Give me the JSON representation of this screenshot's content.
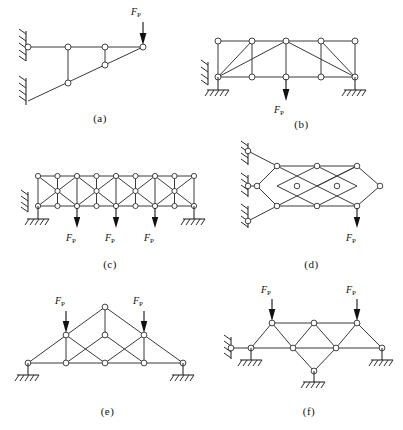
{
  "sheet": {
    "title": "Truss structure exercise figures",
    "figure_count": 6,
    "load_symbol": "F",
    "load_subscript": "P",
    "line_color": "#3a3a3a",
    "joint_fill": "#ffffff",
    "joint_stroke": "#2f2f2f",
    "text_color": "#111111",
    "background": "#ffffff"
  },
  "figures": [
    {
      "id": "a",
      "caption": "(a)",
      "description": "Cantilever truss with horizontal top chord, inclined bottom chord and two vertical members, fixed to wall at two levels",
      "loads": [
        {
          "label": "F",
          "subscript": "P",
          "direction": "down",
          "at_joint": "top-right"
        }
      ],
      "supports": [
        {
          "type": "wall-hatch",
          "position": "upper-left"
        },
        {
          "type": "wall-hatch",
          "position": "lower-left"
        }
      ],
      "joint_count": 6
    },
    {
      "id": "b",
      "caption": "(b)",
      "description": "Parallel chord truss, four panels, with X/diagonal bracing in the two central panels and verticals at panel points",
      "loads": [
        {
          "label": "F",
          "subscript": "P",
          "direction": "down",
          "at_joint": "bottom-middle"
        }
      ],
      "supports": [
        {
          "type": "wall-hatch",
          "position": "left"
        },
        {
          "type": "ground-hatch",
          "position": "bottom-left"
        },
        {
          "type": "ground-hatch",
          "position": "bottom-right"
        }
      ],
      "joint_count": 10
    },
    {
      "id": "c",
      "caption": "(c)",
      "description": "Long parallel chord truss of eight panels with repeating diagonal lattice and intermediate mid-height joints",
      "loads": [
        {
          "label": "F",
          "subscript": "P",
          "direction": "down",
          "at_joint": "bottom-panel-2"
        },
        {
          "label": "F",
          "subscript": "P",
          "direction": "down",
          "at_joint": "bottom-panel-4"
        },
        {
          "label": "F",
          "subscript": "P",
          "direction": "down",
          "at_joint": "bottom-panel-6"
        }
      ],
      "supports": [
        {
          "type": "wall-hatch",
          "position": "left"
        },
        {
          "type": "ground-hatch",
          "position": "bottom-left"
        },
        {
          "type": "ground-hatch",
          "position": "bottom-right"
        }
      ],
      "joint_count": 22
    },
    {
      "id": "d",
      "caption": "(d)",
      "description": "Diamond lattice truss cantilevered from a wall with three hatched wall supports on the left",
      "loads": [
        {
          "label": "F",
          "subscript": "P",
          "direction": "down",
          "at_joint": "bottom-right"
        }
      ],
      "supports": [
        {
          "type": "wall-hatch",
          "position": "upper-left"
        },
        {
          "type": "wall-hatch",
          "position": "middle-left"
        },
        {
          "type": "wall-hatch",
          "position": "lower-left"
        }
      ],
      "joint_count": 11
    },
    {
      "id": "e",
      "caption": "(e)",
      "description": "Triangular roof truss with apex, inclined top chords, horizontal bottom chord, verticals and crossed web diagonals",
      "loads": [
        {
          "label": "F",
          "subscript": "P",
          "direction": "down",
          "at_joint": "left-upper-chord"
        },
        {
          "label": "F",
          "subscript": "P",
          "direction": "down",
          "at_joint": "right-upper-chord"
        }
      ],
      "supports": [
        {
          "type": "ground-hatch",
          "position": "bottom-left"
        },
        {
          "type": "ground-hatch",
          "position": "bottom-right"
        }
      ],
      "joint_count": 9
    },
    {
      "id": "f",
      "caption": "(f)",
      "description": "Shallow truss with raised top chord, central diamond panel and three ground supports plus a wall support at left",
      "loads": [
        {
          "label": "F",
          "subscript": "P",
          "direction": "down",
          "at_joint": "top-left"
        },
        {
          "label": "F",
          "subscript": "P",
          "direction": "down",
          "at_joint": "top-right"
        }
      ],
      "supports": [
        {
          "type": "wall-hatch",
          "position": "left"
        },
        {
          "type": "ground-hatch",
          "position": "bottom-left"
        },
        {
          "type": "ground-hatch",
          "position": "bottom-center"
        },
        {
          "type": "ground-hatch",
          "position": "bottom-right"
        }
      ],
      "joint_count": 9
    }
  ]
}
